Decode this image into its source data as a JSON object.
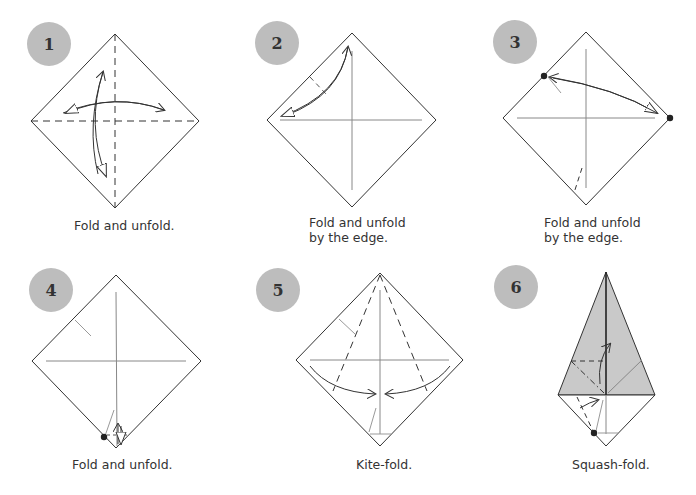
{
  "colors": {
    "badge": "#bdbdbd",
    "paper_shaded": "#c9c9c9",
    "line": "#333333",
    "crease": "#888888"
  },
  "steps": [
    {
      "number": "1",
      "caption": "Fold and unfold."
    },
    {
      "number": "2",
      "caption": "Fold and unfold\nby the edge."
    },
    {
      "number": "3",
      "caption": "Fold and unfold\nby the edge."
    },
    {
      "number": "4",
      "caption": "Fold and unfold."
    },
    {
      "number": "5",
      "caption": "Kite-fold."
    },
    {
      "number": "6",
      "caption": "Squash-fold."
    }
  ]
}
